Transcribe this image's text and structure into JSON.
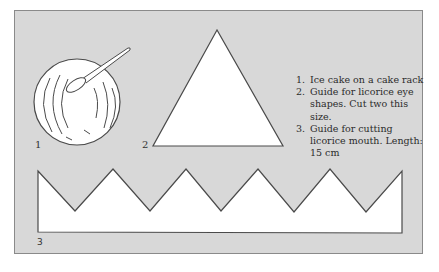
{
  "figure": {
    "background_color": "#d8d8d8",
    "shape_fill": "#ffffff",
    "stroke_color": "#4a4a4a",
    "labels": {
      "fig1": "1",
      "fig2": "2",
      "fig3": "3"
    },
    "legend": {
      "items": [
        "Ice cake on a cake rack",
        "Guide for licorice eye shapes. Cut two this size.",
        "Guide for cutting licorice mouth. Length: 15 cm"
      ]
    }
  }
}
